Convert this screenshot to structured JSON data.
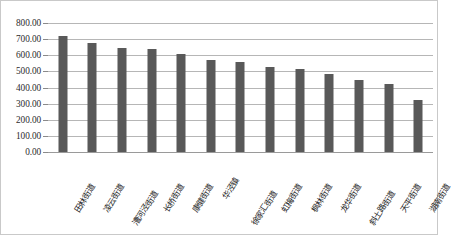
{
  "chart_data": {
    "type": "bar",
    "title": "",
    "subtitle": "",
    "xlabel": "",
    "ylabel": "",
    "ylim": [
      0,
      800
    ],
    "ytick_step": 100,
    "ytick_labels": [
      "800.00",
      "700.00",
      "600.00",
      "500.00",
      "400.00",
      "300.00",
      "200.00",
      "100.00",
      "0.00"
    ],
    "ytick_values": [
      800,
      700,
      600,
      500,
      400,
      300,
      200,
      100,
      0
    ],
    "grid": true,
    "grid_axis": "y",
    "legend": false,
    "legend_position": "none",
    "bar_color": "#595959",
    "gridline_color": "#b6b6b6",
    "border_color": "#c9c9c9",
    "categories": [
      "田林街道",
      "凌云街道",
      "漕河泾街道",
      "长桥街道",
      "康健街道",
      "华泾镇",
      "徐家汇街道",
      "虹梅街道",
      "枫林街道",
      "龙华街道",
      "斜土路街道",
      "天平街道",
      "湖南街道"
    ],
    "values": [
      718,
      675,
      645,
      637,
      610,
      568,
      557,
      528,
      512,
      483,
      445,
      421,
      323
    ],
    "series": [
      {
        "name": "",
        "values": [
          718,
          675,
          645,
          637,
          610,
          568,
          557,
          528,
          512,
          483,
          445,
          421,
          323
        ]
      }
    ]
  }
}
